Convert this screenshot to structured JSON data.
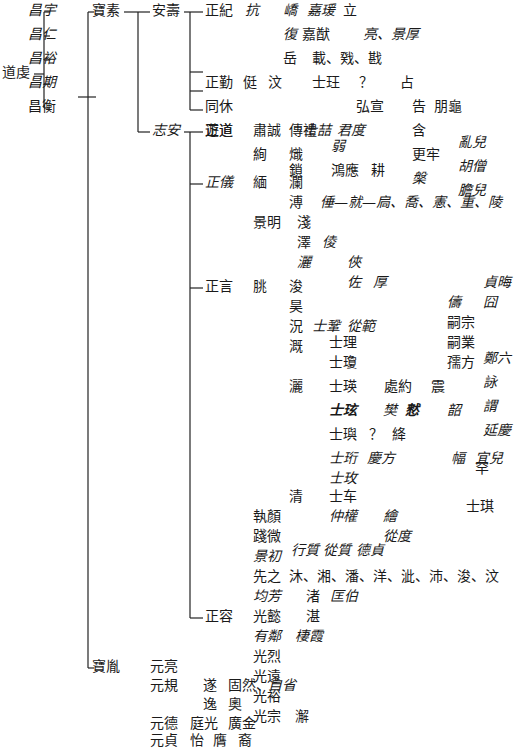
{
  "diagram": {
    "type": "genealogy-tree",
    "root": "道虔",
    "nodes": [
      {
        "id": "daoqian",
        "text": "道虔",
        "x": 2,
        "y": 73,
        "italic": false
      },
      {
        "id": "changyu",
        "text": "昌宇",
        "x": 28,
        "y": 11,
        "italic": true
      },
      {
        "id": "changren",
        "text": "昌仁",
        "x": 28,
        "y": 35,
        "italic": true
      },
      {
        "id": "changyu2",
        "text": "昌裕",
        "x": 28,
        "y": 59,
        "italic": true
      },
      {
        "id": "changqi",
        "text": "昌期",
        "x": 28,
        "y": 83,
        "italic": true
      },
      {
        "id": "changheng",
        "text": "昌衡",
        "x": 28,
        "y": 107,
        "italic": false
      },
      {
        "id": "baosu",
        "text": "寶素",
        "x": 92,
        "y": 11,
        "italic": false
      },
      {
        "id": "anshou",
        "text": "安壽",
        "x": 152,
        "y": 11,
        "italic": false
      },
      {
        "id": "zhengji",
        "text": "正紀",
        "x": 205,
        "y": 11,
        "italic": false
      },
      {
        "id": "kang",
        "text": "抗",
        "x": 245,
        "y": 11,
        "italic": true
      },
      {
        "id": "qiao",
        "text": "嶠",
        "x": 283,
        "y": 11,
        "italic": true
      },
      {
        "id": "jiayuan",
        "text": "嘉瑗",
        "x": 307,
        "y": 11,
        "italic": true
      },
      {
        "id": "li",
        "text": "立",
        "x": 343,
        "y": 11,
        "italic": false
      },
      {
        "id": "fu",
        "text": "復",
        "x": 283,
        "y": 35,
        "italic": true
      },
      {
        "id": "jiaxian",
        "text": "嘉猷",
        "x": 302,
        "y": 35,
        "italic": false
      },
      {
        "id": "liang",
        "text": "亮、景厚",
        "x": 363,
        "y": 35,
        "italic": true
      },
      {
        "id": "yue",
        "text": "岳",
        "x": 283,
        "y": 59,
        "italic": false
      },
      {
        "id": "zai",
        "text": "載、戣、戡",
        "x": 312,
        "y": 59,
        "italic": false
      },
      {
        "id": "zhengqin",
        "text": "正勤",
        "x": 205,
        "y": 83,
        "italic": false
      },
      {
        "id": "ting",
        "text": "侹",
        "x": 243,
        "y": 83,
        "italic": false
      },
      {
        "id": "wen",
        "text": "汶",
        "x": 268,
        "y": 83,
        "italic": false
      },
      {
        "id": "shiwang",
        "text": "士玨",
        "x": 312,
        "y": 83,
        "italic": false
      },
      {
        "id": "q1",
        "text": "？",
        "x": 359,
        "y": 83,
        "italic": false
      },
      {
        "id": "zhan",
        "text": "占",
        "x": 400,
        "y": 83,
        "italic": false
      },
      {
        "id": "hongxuan",
        "text": "弘宣",
        "x": 356,
        "y": 107,
        "italic": false
      },
      {
        "id": "gao",
        "text": "告",
        "x": 412,
        "y": 107,
        "italic": false
      },
      {
        "id": "penggui",
        "text": "朋龜",
        "x": 434,
        "y": 107,
        "italic": false
      },
      {
        "id": "tongxiu",
        "text": "同休",
        "x": 205,
        "y": 107,
        "italic": false
      },
      {
        "id": "shiji",
        "text": "士喆",
        "x": 303,
        "y": 131,
        "italic": true
      },
      {
        "id": "junshu",
        "text": "君度",
        "x": 337,
        "y": 131,
        "italic": true
      },
      {
        "id": "han",
        "text": "含",
        "x": 412,
        "y": 131,
        "italic": false
      },
      {
        "id": "zhengdao",
        "text": "正道",
        "x": 205,
        "y": 131,
        "italic": false
      },
      {
        "id": "gengnian",
        "text": "更牢",
        "x": 412,
        "y": 155,
        "italic": false
      },
      {
        "id": "luaner",
        "text": "亂兒",
        "x": 458,
        "y": 143,
        "italic": true
      },
      {
        "id": "li2",
        "text": "槃",
        "x": 412,
        "y": 179,
        "italic": true
      },
      {
        "id": "huzeng",
        "text": "胡僧",
        "x": 458,
        "y": 167,
        "italic": true
      },
      {
        "id": "zhian",
        "text": "志安",
        "x": 152,
        "y": 131,
        "italic": true
      },
      {
        "id": "youdao",
        "text": "遊道",
        "x": 205,
        "y": 131,
        "italic": false
      },
      {
        "id": "suqian",
        "text": "肅誠",
        "x": 253,
        "y": 131,
        "italic": false
      },
      {
        "id": "chuanli",
        "text": "傳禮",
        "x": 289,
        "y": 131,
        "italic": false
      },
      {
        "id": "xun",
        "text": "絢",
        "x": 253,
        "y": 155,
        "italic": false
      },
      {
        "id": "chi",
        "text": "熾",
        "x": 289,
        "y": 155,
        "italic": false
      },
      {
        "id": "ruo",
        "text": "弱",
        "x": 331,
        "y": 147,
        "italic": true
      },
      {
        "id": "suo",
        "text": "鎖",
        "x": 289,
        "y": 171,
        "italic": false
      },
      {
        "id": "hongying",
        "text": "鴻應",
        "x": 331,
        "y": 171,
        "italic": false
      },
      {
        "id": "geng",
        "text": "耕",
        "x": 371,
        "y": 171,
        "italic": false
      },
      {
        "id": "danger",
        "text": "膽兒",
        "x": 458,
        "y": 191,
        "italic": true
      },
      {
        "id": "zhengyi",
        "text": "正儀",
        "x": 205,
        "y": 183,
        "italic": true
      },
      {
        "id": "mian",
        "text": "緬",
        "x": 253,
        "y": 183,
        "italic": false
      },
      {
        "id": "lan",
        "text": "瀾",
        "x": 289,
        "y": 183,
        "italic": false
      },
      {
        "id": "pu",
        "text": "溥",
        "x": 289,
        "y": 203,
        "italic": false
      },
      {
        "id": "puchain",
        "text": "倕—就—扃、喬、憲、重、陵",
        "x": 320,
        "y": 203,
        "italic": true
      },
      {
        "id": "jingming",
        "text": "景明",
        "x": 253,
        "y": 223,
        "italic": false
      },
      {
        "id": "qian",
        "text": "淺",
        "x": 297,
        "y": 223,
        "italic": false
      },
      {
        "id": "ze",
        "text": "澤",
        "x": 297,
        "y": 243,
        "italic": false
      },
      {
        "id": "hou",
        "text": "倰",
        "x": 322,
        "y": 243,
        "italic": true
      },
      {
        "id": "sa",
        "text": "灑",
        "x": 297,
        "y": 263,
        "italic": true
      },
      {
        "id": "xia",
        "text": "俠",
        "x": 347,
        "y": 263,
        "italic": true
      },
      {
        "id": "zuo",
        "text": "佐",
        "x": 347,
        "y": 283,
        "italic": true
      },
      {
        "id": "houhou",
        "text": "厚",
        "x": 373,
        "y": 283,
        "italic": true
      },
      {
        "id": "zhenhui",
        "text": "貞晦",
        "x": 483,
        "y": 283,
        "italic": true
      },
      {
        "id": "zhengyan",
        "text": "正言",
        "x": 205,
        "y": 287,
        "italic": false
      },
      {
        "id": "tiao",
        "text": "朓",
        "x": 253,
        "y": 287,
        "italic": false
      },
      {
        "id": "jun",
        "text": "浚",
        "x": 289,
        "y": 287,
        "italic": false
      },
      {
        "id": "chou",
        "text": "儔",
        "x": 447,
        "y": 303,
        "italic": true
      },
      {
        "id": "jiong",
        "text": "囧",
        "x": 483,
        "y": 303,
        "italic": true
      },
      {
        "id": "hao",
        "text": "昊",
        "x": 289,
        "y": 307,
        "italic": false
      },
      {
        "id": "kuang",
        "text": "況",
        "x": 289,
        "y": 327,
        "italic": false
      },
      {
        "id": "shiju",
        "text": "士鞏",
        "x": 312,
        "y": 327,
        "italic": true
      },
      {
        "id": "congfan",
        "text": "從範",
        "x": 347,
        "y": 327,
        "italic": true
      },
      {
        "id": "sizong",
        "text": "嗣宗",
        "x": 447,
        "y": 323,
        "italic": false
      },
      {
        "id": "ji",
        "text": "溉",
        "x": 289,
        "y": 347,
        "italic": false
      },
      {
        "id": "shili",
        "text": "士理",
        "x": 329,
        "y": 343,
        "italic": false
      },
      {
        "id": "siye",
        "text": "嗣業",
        "x": 447,
        "y": 343,
        "italic": false
      },
      {
        "id": "shiqiong",
        "text": "士瓊",
        "x": 329,
        "y": 363,
        "italic": false
      },
      {
        "id": "rufang",
        "text": "孺方",
        "x": 447,
        "y": 363,
        "italic": false
      },
      {
        "id": "jia",
        "text": "灑",
        "x": 289,
        "y": 387,
        "italic": false
      },
      {
        "id": "shiying",
        "text": "士瑛",
        "x": 329,
        "y": 387,
        "italic": false
      },
      {
        "id": "chuyue",
        "text": "處約",
        "x": 384,
        "y": 387,
        "italic": false
      },
      {
        "id": "zhen",
        "text": "震",
        "x": 431,
        "y": 387,
        "italic": false
      },
      {
        "id": "zhengliu",
        "text": "鄭六",
        "x": 483,
        "y": 359,
        "italic": true
      },
      {
        "id": "yong",
        "text": "詠",
        "x": 483,
        "y": 383,
        "italic": true
      },
      {
        "id": "shixuan",
        "text": "士玹",
        "x": 329,
        "y": 411,
        "italic": true,
        "bold": true
      },
      {
        "id": "fan",
        "text": "樊",
        "x": 383,
        "y": 411,
        "italic": true
      },
      {
        "id": "yin",
        "text": "憖",
        "x": 405,
        "y": 411,
        "italic": true,
        "bold": true
      },
      {
        "id": "zhao",
        "text": "韶",
        "x": 447,
        "y": 411,
        "italic": true
      },
      {
        "id": "wei",
        "text": "謂",
        "x": 483,
        "y": 407,
        "italic": true
      },
      {
        "id": "yanqing",
        "text": "延慶",
        "x": 483,
        "y": 431,
        "italic": true
      },
      {
        "id": "shiyu",
        "text": "士璵",
        "x": 329,
        "y": 435,
        "italic": false
      },
      {
        "id": "q2",
        "text": "？",
        "x": 369,
        "y": 435,
        "italic": false
      },
      {
        "id": "jiang",
        "text": "絳",
        "x": 392,
        "y": 435,
        "italic": false
      },
      {
        "id": "shiheng",
        "text": "士珩",
        "x": 329,
        "y": 459,
        "italic": true
      },
      {
        "id": "qingfang",
        "text": "慶方",
        "x": 367,
        "y": 459,
        "italic": true
      },
      {
        "id": "fu2",
        "text": "幅",
        "x": 451,
        "y": 459,
        "italic": true
      },
      {
        "id": "yier",
        "text": "宜兒",
        "x": 475,
        "y": 459,
        "italic": true
      },
      {
        "id": "shixuan2",
        "text": "士玫",
        "x": 329,
        "y": 479,
        "italic": true
      },
      {
        "id": "qing",
        "text": "清",
        "x": 289,
        "y": 497,
        "italic": false
      },
      {
        "id": "shiche",
        "text": "士车",
        "x": 329,
        "y": 497,
        "italic": false
      },
      {
        "id": "zhongquan",
        "text": "仲權",
        "x": 329,
        "y": 517,
        "italic": true
      },
      {
        "id": "hui",
        "text": "繪",
        "x": 383,
        "y": 517,
        "italic": true
      },
      {
        "id": "congdu",
        "text": "從度",
        "x": 383,
        "y": 537,
        "italic": true
      },
      {
        "id": "han2",
        "text": "罕",
        "x": 475,
        "y": 469,
        "italic": false
      },
      {
        "id": "shiqi",
        "text": "士琪",
        "x": 466,
        "y": 507,
        "italic": false
      },
      {
        "id": "zhiyan",
        "text": "執顏",
        "x": 253,
        "y": 517,
        "italic": false
      },
      {
        "id": "jianwei",
        "text": "踐微",
        "x": 253,
        "y": 537,
        "italic": false
      },
      {
        "id": "jingchu",
        "text": "景初",
        "x": 253,
        "y": 557,
        "italic": true
      },
      {
        "id": "brace_names",
        "text": "行質  從質  德貞",
        "x": 291,
        "y": 551,
        "italic": true
      },
      {
        "id": "xianzhi",
        "text": "先之",
        "x": 253,
        "y": 577,
        "italic": false
      },
      {
        "id": "xianzhi_sons",
        "text": "沐、湘、潘、洋、泚、沛、浚、汶",
        "x": 289,
        "y": 577,
        "italic": false
      },
      {
        "id": "zhengrong",
        "text": "正容",
        "x": 205,
        "y": 617,
        "italic": false
      },
      {
        "id": "junfang",
        "text": "均芳",
        "x": 253,
        "y": 597,
        "italic": true
      },
      {
        "id": "zhu",
        "text": "渚",
        "x": 306,
        "y": 597,
        "italic": false
      },
      {
        "id": "kuangbo",
        "text": "匡伯",
        "x": 330,
        "y": 597,
        "italic": true
      },
      {
        "id": "guangyi",
        "text": "光懿",
        "x": 253,
        "y": 617,
        "italic": false
      },
      {
        "id": "zhan2",
        "text": "湛",
        "x": 306,
        "y": 617,
        "italic": false
      },
      {
        "id": "youlin",
        "text": "有鄰",
        "x": 253,
        "y": 637,
        "italic": true
      },
      {
        "id": "qixia",
        "text": "棲霞",
        "x": 295,
        "y": 637,
        "italic": true
      },
      {
        "id": "guanglie",
        "text": "光烈",
        "x": 253,
        "y": 657,
        "italic": false
      },
      {
        "id": "guangyuan",
        "text": "光遠",
        "x": 253,
        "y": 677,
        "italic": false
      },
      {
        "id": "guangyu",
        "text": "光裕",
        "x": 253,
        "y": 697,
        "italic": false
      },
      {
        "id": "guangzong",
        "text": "光宗",
        "x": 253,
        "y": 717,
        "italic": false
      },
      {
        "id": "xie",
        "text": "澥",
        "x": 295,
        "y": 717,
        "italic": false
      },
      {
        "id": "baoyin",
        "text": "寶胤",
        "x": 92,
        "y": 667,
        "italic": false
      },
      {
        "id": "yuanliang",
        "text": "元亮",
        "x": 150,
        "y": 667,
        "italic": false
      },
      {
        "id": "yuangui",
        "text": "元規",
        "x": 150,
        "y": 686,
        "italic": false
      },
      {
        "id": "sui",
        "text": "遂",
        "x": 203,
        "y": 686,
        "italic": false
      },
      {
        "id": "guran",
        "text": "固然、",
        "x": 228,
        "y": 686,
        "italic": false
      },
      {
        "id": "zixing",
        "text": "自省",
        "x": 268,
        "y": 686,
        "italic": true
      },
      {
        "id": "yi",
        "text": "逸",
        "x": 203,
        "y": 705,
        "italic": false
      },
      {
        "id": "ao",
        "text": "奧",
        "x": 228,
        "y": 705,
        "italic": false
      },
      {
        "id": "yuande",
        "text": "元德",
        "x": 150,
        "y": 724,
        "italic": false
      },
      {
        "id": "tingguang",
        "text": "庭光",
        "x": 190,
        "y": 724,
        "italic": false
      },
      {
        "id": "guangjin",
        "text": "廣金",
        "x": 228,
        "y": 724,
        "italic": false
      },
      {
        "id": "yuanzhen",
        "text": "元貞",
        "x": 150,
        "y": 741,
        "italic": false
      },
      {
        "id": "yi2",
        "text": "怡",
        "x": 190,
        "y": 741,
        "italic": false
      },
      {
        "id": "yong2",
        "text": "膺",
        "x": 213,
        "y": 741,
        "italic": false
      },
      {
        "id": "yu",
        "text": "裔",
        "x": 238,
        "y": 741,
        "italic": false
      }
    ]
  }
}
